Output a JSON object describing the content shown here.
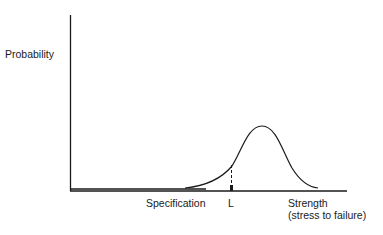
{
  "diagram": {
    "y_axis_label": "Probability",
    "x_axis_label_line1": "Strength",
    "x_axis_label_line2": "(stress to failure)",
    "specification_label": "Specification",
    "limit_label": "L",
    "curve": "bell-shaped strength distribution",
    "line_color": "#1a1a1a"
  }
}
